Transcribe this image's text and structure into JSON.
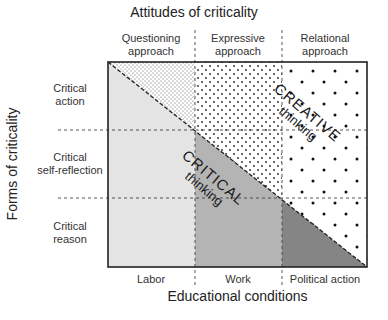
{
  "diagram": {
    "top_axis_title": "Attitudes of criticality",
    "left_axis_title": "Forms of criticality",
    "bottom_axis_title": "Educational conditions",
    "columns": [
      {
        "line1": "Questioning",
        "line2": "approach"
      },
      {
        "line1": "Expressive",
        "line2": "approach"
      },
      {
        "line1": "Relational",
        "line2": "approach"
      }
    ],
    "rows": [
      {
        "line1": "Critical",
        "line2": "action"
      },
      {
        "line1": "Critical",
        "line2": "self-reflection"
      },
      {
        "line1": "Critical",
        "line2": "reason"
      }
    ],
    "bottom_labels": [
      "Labor",
      "Work",
      "Political action"
    ],
    "regions": {
      "critical": {
        "word": "CRITICAL",
        "sub": "thinking"
      },
      "creative": {
        "word": "CREATIVE",
        "sub": "thinking"
      }
    },
    "colors": {
      "light_gray": "#e4e4e4",
      "mid_gray": "#b4b4b4",
      "dark_gray": "#858585",
      "border": "#222222",
      "dot": "#222222"
    }
  }
}
